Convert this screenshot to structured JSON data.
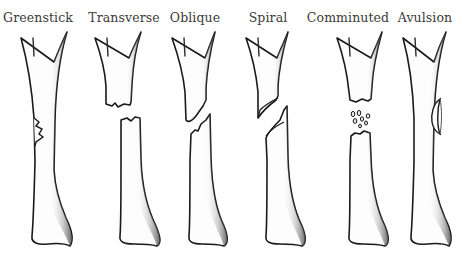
{
  "fractures": [
    {
      "id": "greenstick",
      "label": "Greenstick"
    },
    {
      "id": "transverse",
      "label": "Transverse"
    },
    {
      "id": "oblique",
      "label": "Oblique"
    },
    {
      "id": "spiral",
      "label": "Spiral"
    },
    {
      "id": "comminuted",
      "label": "Comminuted"
    },
    {
      "id": "avulsion",
      "label": "Avulsion"
    }
  ],
  "colors": {
    "background": "#ffffff",
    "line": "#1a1a1a",
    "shade": "#6a6a6a",
    "text": "#3a3a3a"
  }
}
